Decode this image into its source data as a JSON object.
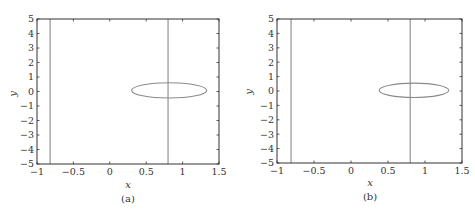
{
  "chart_data": [
    {
      "type": "line",
      "panel_label": "(a)",
      "title": "",
      "xlabel": "x",
      "ylabel": "y",
      "xlim": [
        -1,
        1.5
      ],
      "ylim": [
        -5,
        5
      ],
      "x_ticks": [
        "-1",
        "-0.5",
        "0",
        "0.5",
        "1",
        "1.5"
      ],
      "y_ticks": [
        "5",
        "4",
        "3",
        "2",
        "1",
        "0",
        "-1",
        "-2",
        "-3",
        "-4",
        "-5"
      ],
      "grid": false,
      "legend": null,
      "series": [
        {
          "name": "vertical-line-left",
          "shape": "vline",
          "x": -0.82
        },
        {
          "name": "vertical-line-right",
          "shape": "vline",
          "x": 0.8
        },
        {
          "name": "ellipse",
          "shape": "ellipse",
          "cx": 0.82,
          "cy": 0.07,
          "rx": 0.52,
          "ry": 0.52,
          "x_range": [
            0.3,
            1.33
          ],
          "y_range": [
            -0.45,
            0.6
          ]
        }
      ],
      "line_color": "#8a8a8a"
    },
    {
      "type": "line",
      "panel_label": "(b)",
      "title": "",
      "xlabel": "x",
      "ylabel": "y",
      "xlim": [
        -1,
        1.5
      ],
      "ylim": [
        -5,
        5
      ],
      "x_ticks": [
        "-1",
        "-0.5",
        "0",
        "0.5",
        "1",
        "1.5"
      ],
      "y_ticks": [
        "5",
        "4",
        "3",
        "2",
        "1",
        "0",
        "-1",
        "-2",
        "-3",
        "-4",
        "-5"
      ],
      "grid": false,
      "legend": null,
      "series": [
        {
          "name": "vertical-line-left",
          "shape": "vline",
          "x": -0.81
        },
        {
          "name": "vertical-line-right",
          "shape": "vline",
          "x": 0.8
        },
        {
          "name": "ellipse",
          "shape": "ellipse",
          "cx": 0.85,
          "cy": 0.05,
          "rx": 0.47,
          "ry": 0.5,
          "x_range": [
            0.38,
            1.32
          ],
          "y_range": [
            -0.45,
            0.55
          ]
        }
      ],
      "line_color": "#8a8a8a"
    }
  ],
  "panels": {
    "a": {
      "label": "(a)",
      "xlabel": "x",
      "ylabel": "y"
    },
    "b": {
      "label": "(b)",
      "xlabel": "x",
      "ylabel": "y"
    }
  }
}
